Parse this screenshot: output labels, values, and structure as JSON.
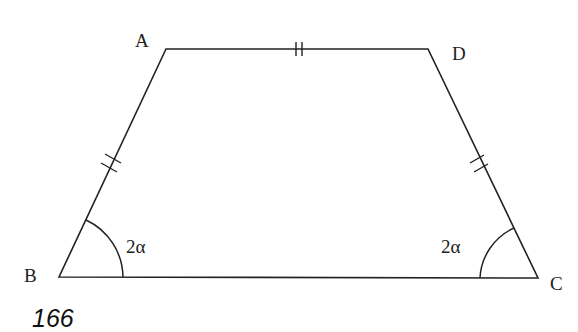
{
  "figure": {
    "type": "isosceles trapezoid",
    "vertices": [
      {
        "name": "A",
        "x": 166,
        "y": 49
      },
      {
        "name": "D",
        "x": 428,
        "y": 49
      },
      {
        "name": "C",
        "x": 538,
        "y": 278
      },
      {
        "name": "B",
        "x": 59,
        "y": 277
      }
    ],
    "labels": {
      "A": "A",
      "B": "B",
      "C": "C",
      "D": "D"
    },
    "angles": {
      "B": "2α",
      "C": "2α"
    },
    "equal_marks": [
      "AB",
      "AD",
      "DC"
    ],
    "stroke_color": "#222222"
  },
  "page_number": "166"
}
